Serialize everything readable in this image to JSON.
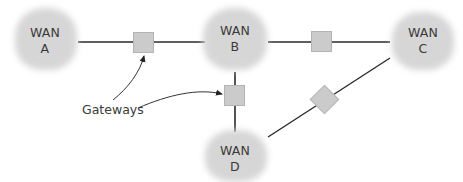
{
  "diagram": {
    "networks": [
      {
        "id": "A",
        "line1": "WAN",
        "line2": "A"
      },
      {
        "id": "B",
        "line1": "WAN",
        "line2": "B"
      },
      {
        "id": "C",
        "line1": "WAN",
        "line2": "C"
      },
      {
        "id": "D",
        "line1": "WAN",
        "line2": "D"
      }
    ],
    "callout": {
      "label": "Gateways"
    },
    "links": [
      {
        "from": "A",
        "to": "B",
        "via": "gateway-1"
      },
      {
        "from": "B",
        "to": "C",
        "via": "gateway-2"
      },
      {
        "from": "B",
        "to": "D",
        "via": "gateway-3"
      },
      {
        "from": "C",
        "to": "D",
        "via": "gateway-4"
      }
    ],
    "colors": {
      "cloud": "#d6d6d6",
      "gateway": "#cbcbcb",
      "line": "#2a2a2a",
      "text": "#3a3a3a"
    }
  }
}
